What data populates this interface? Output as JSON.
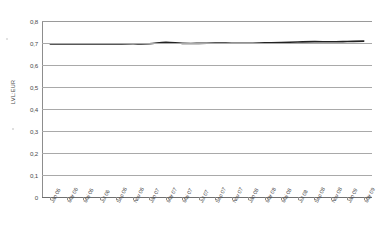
{
  "chart_data": {
    "type": "line",
    "title": "",
    "subtitle": "",
    "xlabel": "",
    "ylabel": "LVL:EUR",
    "ylim": [
      0,
      0.8
    ],
    "ytick_labels": [
      "0,8",
      "0,7",
      "0,6",
      "0,5",
      "0,4",
      "0,3",
      "0,2",
      "0,1",
      "0"
    ],
    "ytick_values": [
      0.8,
      0.7,
      0.6,
      0.5,
      0.4,
      0.3,
      0.2,
      0.1,
      0
    ],
    "grid": true,
    "legend": "none",
    "categories": [
      "Jän 06",
      "Mär 06",
      "Mai 06",
      "Jul 06",
      "Sep 06",
      "Nov 06",
      "Jän 07",
      "Mär 07",
      "Mai 07",
      "Jul 07",
      "Sep 07",
      "Nov 07",
      "Jän 08",
      "Mär 08",
      "Mai 08",
      "Jul 08",
      "Sep 08",
      "Nov 08",
      "Jän 09",
      "Mär 09"
    ],
    "series": [
      {
        "name": "LVL:EUR",
        "values": [
          0.696,
          0.6962,
          0.6961,
          0.696,
          0.6962,
          0.6963,
          0.6968,
          0.7035,
          0.6985,
          0.6982,
          0.6998,
          0.6992,
          0.6988,
          0.7005,
          0.702,
          0.7048,
          0.7062,
          0.7055,
          0.7068,
          0.7085
        ]
      }
    ],
    "value_range": [
      0.696,
      0.712
    ]
  }
}
